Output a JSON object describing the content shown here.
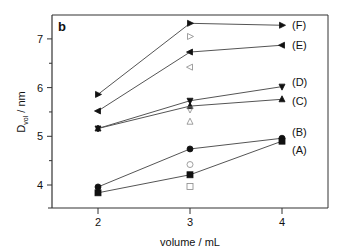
{
  "chart_data": {
    "type": "line",
    "panel_label": "b",
    "title": "",
    "xlabel": "volume / mL",
    "ylabel": "D",
    "ylabel_subscript": "vol",
    "ylabel_unit": " / nm",
    "xlim": [
      1.5,
      4.5
    ],
    "ylim": [
      3.53,
      7.5
    ],
    "xticks": [
      2,
      3,
      4
    ],
    "yticks": [
      4,
      5,
      6,
      7
    ],
    "grid": false,
    "legend_position": "inline-right",
    "x": [
      2,
      3,
      4
    ],
    "series": [
      {
        "name": "(F)",
        "marker": "triangle-right-filled",
        "values": [
          5.86,
          7.32,
          7.28
        ]
      },
      {
        "name": "(E)",
        "marker": "triangle-left-filled",
        "values": [
          5.52,
          6.73,
          6.87
        ]
      },
      {
        "name": "(D)",
        "marker": "triangle-down-filled",
        "values": [
          5.16,
          5.73,
          6.02
        ]
      },
      {
        "name": "(C)",
        "marker": "triangle-up-filled",
        "values": [
          5.16,
          5.62,
          5.76
        ]
      },
      {
        "name": "(B)",
        "marker": "circle-filled",
        "values": [
          3.96,
          4.74,
          4.96
        ]
      },
      {
        "name": "(A)",
        "marker": "square-filled",
        "values": [
          3.84,
          4.21,
          4.9
        ]
      }
    ],
    "open_points": [
      {
        "marker": "triangle-right-open",
        "x": 3,
        "y": 7.05
      },
      {
        "marker": "triangle-left-open",
        "x": 3,
        "y": 6.42
      },
      {
        "marker": "triangle-down-open",
        "x": 3,
        "y": 5.55
      },
      {
        "marker": "triangle-up-open",
        "x": 3,
        "y": 5.3
      },
      {
        "marker": "circle-open",
        "x": 3,
        "y": 4.42
      },
      {
        "marker": "square-open",
        "x": 3,
        "y": 3.97
      }
    ],
    "colors": {
      "line": "#555555",
      "marker": "#111111",
      "open_marker": "#888888",
      "axis": "#333333"
    }
  }
}
